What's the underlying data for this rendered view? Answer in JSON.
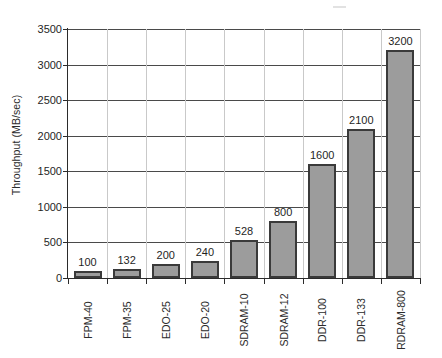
{
  "chart_data": {
    "type": "bar",
    "title": "",
    "xlabel": "",
    "ylabel": "Throughput (MB/sec)",
    "categories": [
      "FPM-40",
      "FPM-35",
      "EDO-25",
      "EDO-20",
      "SDRAM-10",
      "SDRAM-12",
      "DDR-100",
      "DDR-133",
      "RDRAM-800"
    ],
    "values": [
      100,
      132,
      200,
      240,
      528,
      800,
      1600,
      2100,
      3200
    ],
    "value_labels": [
      "100",
      "132",
      "200",
      "240",
      "528",
      "800",
      "1600",
      "2100",
      "3200"
    ],
    "ylim": [
      0,
      3500
    ],
    "ytick_labels": [
      "0",
      "500",
      "1000",
      "1500",
      "2000",
      "2500",
      "3000",
      "3500"
    ],
    "ytick_values": [
      0,
      500,
      1000,
      1500,
      2000,
      2500,
      3000,
      3500
    ],
    "grid": "horizontal-major-and-vertical-category-separators",
    "legend": "none",
    "bar_color": "#9c9c9c",
    "bar_border_color": "#3a3a3a",
    "gridline_color": "#4a4a4a",
    "axis_color": "#2b2b2b",
    "background": "#ffffff"
  }
}
